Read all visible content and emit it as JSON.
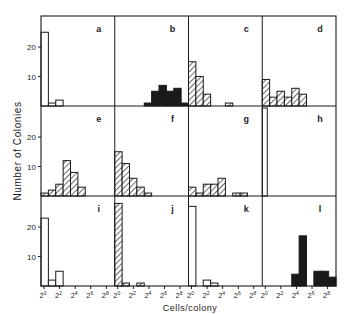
{
  "figure": {
    "ylabel": "Number of Colonies",
    "xlabel": "Cells/colony",
    "y_ticks": [
      "10",
      "20"
    ],
    "x_tick_labels": [
      "2",
      "2",
      "2",
      "2",
      "2"
    ],
    "x_tick_exponents": [
      "0",
      "2",
      "4",
      "6",
      "8"
    ]
  },
  "chart_data": {
    "type": "bar",
    "title": "",
    "xlabel": "Cells/colony",
    "ylabel": "Number of Colonies",
    "x_scale": "log2",
    "x_ticks": [
      "2^0",
      "2^2",
      "2^4",
      "2^6",
      "2^8"
    ],
    "bin_edges_log2": [
      0,
      0.8,
      1.6,
      2.4,
      3.2,
      4.0,
      4.8,
      5.6,
      6.4,
      7.2,
      8.0
    ],
    "ylim": [
      0,
      30
    ],
    "y_ticks": [
      10,
      20
    ],
    "grid": false,
    "layout": "3 rows x 4 columns of histograms",
    "panels": [
      {
        "label": "a",
        "fill": "open",
        "counts": [
          25,
          1,
          2,
          0,
          0,
          0,
          0,
          0,
          0,
          0
        ]
      },
      {
        "label": "b",
        "fill": "solid",
        "counts": [
          0,
          0,
          0,
          0,
          1,
          5,
          7,
          5,
          6,
          1
        ]
      },
      {
        "label": "c",
        "fill": "hatch",
        "counts": [
          15,
          10,
          4,
          0,
          0,
          1,
          0,
          0,
          0,
          0
        ]
      },
      {
        "label": "d",
        "fill": "hatch",
        "counts": [
          9,
          3,
          5,
          3,
          6,
          4,
          0,
          0,
          0,
          0
        ]
      },
      {
        "label": "e",
        "fill": "hatch",
        "counts": [
          1,
          2,
          4,
          12,
          8,
          3,
          0,
          0,
          0,
          0
        ]
      },
      {
        "label": "f",
        "fill": "hatch",
        "counts": [
          15,
          11,
          6,
          3,
          1,
          0,
          0,
          0,
          0,
          0
        ]
      },
      {
        "label": "g",
        "fill": "hatch",
        "counts": [
          3,
          1,
          4,
          4,
          6,
          0,
          1,
          1,
          0,
          0
        ]
      },
      {
        "label": "h",
        "fill": "open",
        "counts": [
          30,
          0,
          0,
          0,
          0,
          0,
          0,
          0,
          0,
          0
        ]
      },
      {
        "label": "i",
        "fill": "open",
        "counts": [
          23,
          2,
          5,
          0,
          0,
          0,
          0,
          0,
          0,
          0
        ]
      },
      {
        "label": "j",
        "fill": "hatch",
        "counts": [
          28,
          1,
          0,
          1,
          0,
          0,
          0,
          0,
          0,
          0
        ]
      },
      {
        "label": "k",
        "fill": "open",
        "counts": [
          27,
          0,
          2,
          1,
          0,
          0,
          0,
          0,
          0,
          0
        ]
      },
      {
        "label": "l",
        "fill": "solid",
        "counts": [
          0,
          0,
          0,
          0,
          4,
          17,
          0,
          5,
          5,
          3
        ]
      }
    ]
  },
  "colors": {
    "ink": "#1a1a1a",
    "background": "#ffffff"
  }
}
